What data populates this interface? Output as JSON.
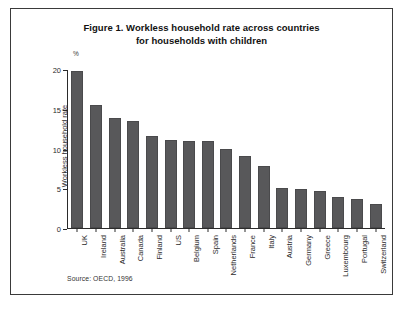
{
  "figure": {
    "title_line1": "Figure 1. Workless household rate across countries",
    "title_line2": "for households with children",
    "source": "Source: OECD, 1996",
    "bar_color": "#58585a",
    "axis_color": "#2b2b2b",
    "frame_color": "#3a3a3a"
  },
  "chart_data": {
    "type": "bar",
    "title": "Figure 1. Workless household rate across countries for households with children",
    "subtitle": "",
    "xlabel": "",
    "ylabel": "Workless household rate",
    "yunit": "%",
    "ylim": [
      0,
      20
    ],
    "yticks": [
      0,
      5,
      10,
      15,
      20
    ],
    "ytick_labels": [
      "0",
      "5",
      "10",
      "15",
      "20"
    ],
    "grid": false,
    "legend": false,
    "categories": [
      "UK",
      "Ireland",
      "Australia",
      "Canada",
      "Finland",
      "US",
      "Belgium",
      "Spain",
      "Netherlands",
      "France",
      "Italy",
      "Austria",
      "Germany",
      "Greece",
      "Luxembourg",
      "Portugal",
      "Switzerland"
    ],
    "values": [
      19.7,
      15.5,
      13.9,
      13.4,
      11.6,
      11.1,
      11.0,
      10.9,
      10.0,
      9.0,
      7.8,
      5.0,
      4.9,
      4.6,
      3.9,
      3.7,
      3.0
    ],
    "annotations": [
      "Source: OECD, 1996"
    ]
  }
}
